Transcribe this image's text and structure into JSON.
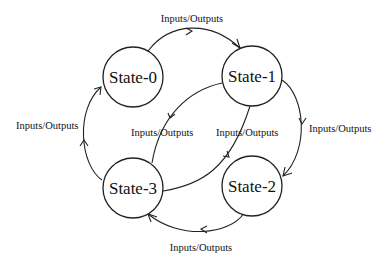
{
  "diagram": {
    "type": "state-machine",
    "states": [
      {
        "id": "s0",
        "label": "State-0"
      },
      {
        "id": "s1",
        "label": "State-1"
      },
      {
        "id": "s2",
        "label": "State-2"
      },
      {
        "id": "s3",
        "label": "State-3"
      }
    ],
    "transitions": [
      {
        "id": "t01",
        "from": "State-0",
        "to": "State-1",
        "label": "Inputs/Outputs"
      },
      {
        "id": "t12",
        "from": "State-1",
        "to": "State-2",
        "label": "Inputs/Outputs"
      },
      {
        "id": "t23",
        "from": "State-2",
        "to": "State-3",
        "label": "Inputs/Outputs"
      },
      {
        "id": "t30",
        "from": "State-3",
        "to": "State-0",
        "label": "Inputs/Outputs"
      },
      {
        "id": "t13",
        "from": "State-1",
        "to": "State-3",
        "label": "Inputs/Outputs"
      },
      {
        "id": "t31",
        "from": "State-3",
        "to": "State-1",
        "label": "Inputs/Outputs"
      }
    ],
    "colors": {
      "stroke": "#222222",
      "background": "#ffffff",
      "text": "#111111"
    }
  }
}
